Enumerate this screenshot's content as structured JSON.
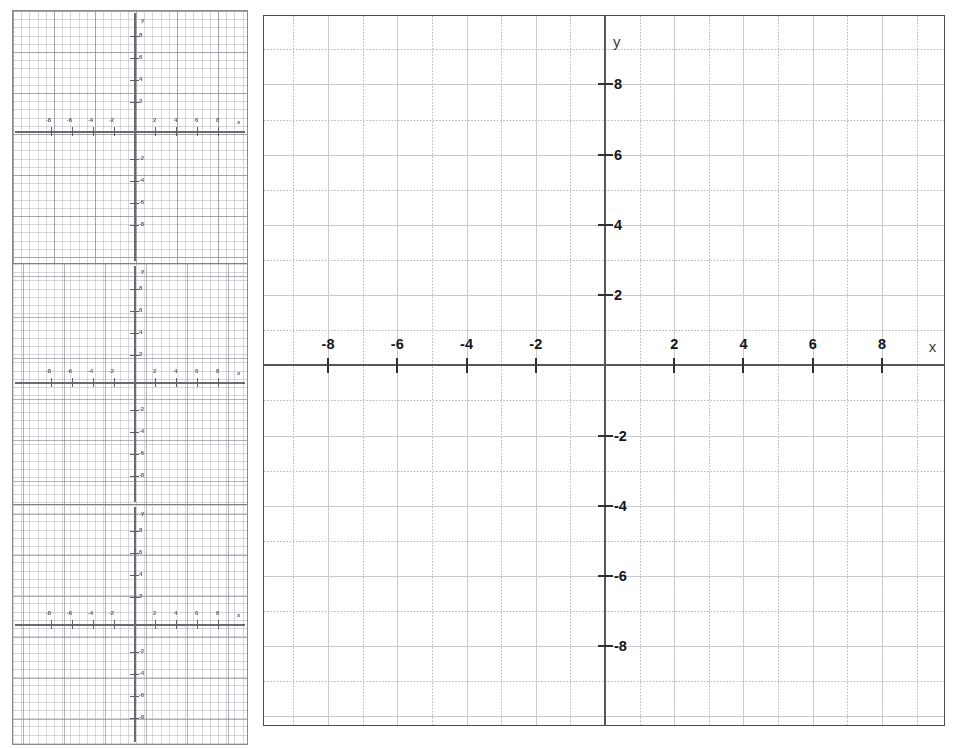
{
  "document": {
    "title": "Blank Coordinate Plane Worksheet",
    "background_color": "#ffffff",
    "axis_color": "#55555d",
    "grid_major_color": "#c9c9cf",
    "grid_minor_color": "#b9b9c2",
    "label_color": "#15151a"
  },
  "main_grid": {
    "name": "coordinate-plane",
    "x_axis_label": "x",
    "y_axis_label": "y",
    "x_tick_labels": [
      "-8",
      "-6",
      "-4",
      "-2",
      "2",
      "4",
      "6",
      "8"
    ],
    "y_tick_labels": [
      "8",
      "6",
      "4",
      "2",
      "-2",
      "-4",
      "-6",
      "-8"
    ]
  },
  "chart_data": {
    "type": "scatter",
    "title": "",
    "subtitle": "",
    "xlabel": "x",
    "ylabel": "y",
    "xlim": [
      -9.85,
      9.85
    ],
    "ylim": [
      -10.3,
      9.95
    ],
    "x_ticks": [
      -8,
      -6,
      -4,
      -2,
      2,
      4,
      6,
      8
    ],
    "y_ticks": [
      8,
      6,
      4,
      2,
      -2,
      -4,
      -6,
      -8
    ],
    "x_tick_labels": [
      "-8",
      "-6",
      "-4",
      "-2",
      "2",
      "4",
      "6",
      "8"
    ],
    "y_tick_labels": [
      "8",
      "6",
      "4",
      "2",
      "-2",
      "-4",
      "-6",
      "-8"
    ],
    "minor_tick_step": 1,
    "major_tick_step": 2,
    "grid": true,
    "grid_style": "solid major lines every 2 units, dotted minor lines every 1 unit",
    "legend": false,
    "legend_position": "none",
    "series": [],
    "values": [],
    "annotations": []
  },
  "thumbnails": {
    "name": "thumbnail-strip",
    "count": 3,
    "panels": [
      {
        "name": "thumbnail-grid-1",
        "x_axis_label": "x",
        "y_axis_label": "y",
        "x_tick_labels": [
          "-8",
          "-6",
          "-4",
          "-2",
          "2",
          "4",
          "6",
          "8"
        ],
        "y_tick_labels": [
          "8",
          "6",
          "4",
          "2",
          "-2",
          "-4",
          "-6",
          "-8"
        ]
      },
      {
        "name": "thumbnail-grid-2",
        "x_axis_label": "x",
        "y_axis_label": "y",
        "x_tick_labels": [
          "-8",
          "-6",
          "-4",
          "-2",
          "2",
          "4",
          "6",
          "8"
        ],
        "y_tick_labels": [
          "8",
          "6",
          "4",
          "2",
          "-2",
          "-4",
          "-6",
          "-8"
        ]
      },
      {
        "name": "thumbnail-grid-3",
        "x_axis_label": "x",
        "y_axis_label": "y",
        "x_tick_labels": [
          "-8",
          "-6",
          "-4",
          "-2",
          "2",
          "4",
          "6",
          "8"
        ],
        "y_tick_labels": [
          "8",
          "6",
          "4",
          "2",
          "-2",
          "-4",
          "-6",
          "-8"
        ]
      }
    ]
  }
}
